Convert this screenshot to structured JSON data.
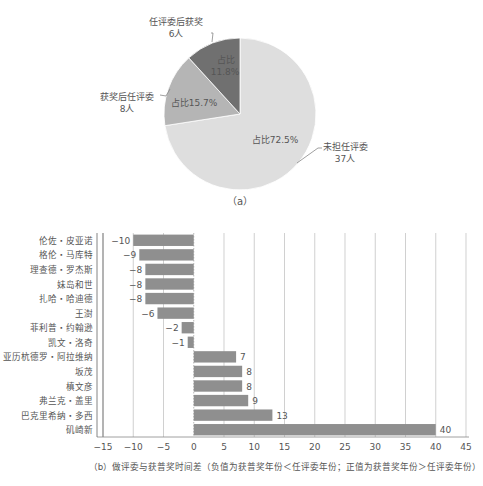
{
  "chart_data": [
    {
      "type": "pie",
      "caption": "（a）",
      "slices": [
        {
          "name": "未担任评委",
          "count_label": "37人",
          "value": 37,
          "pct_label": "占比72.5%",
          "color": "#dedede"
        },
        {
          "name": "获奖后任评委",
          "count_label": "8人",
          "value": 8,
          "pct_label": "占比15.7%",
          "color": "#b5b5b5"
        },
        {
          "name": "任评委后获奖",
          "count_label": "6人",
          "value": 6,
          "pct_label_line1": "占比",
          "pct_label_line2": "11.8%",
          "pct_label": "占比11.8%",
          "color": "#707070"
        }
      ]
    },
    {
      "type": "bar",
      "orientation": "horizontal",
      "caption": "（b）做评委与获普奖时间差（负值为获普奖年份＜任评委年份；正值为获普奖年份＞任评委年份）",
      "categories": [
        "伦佐・皮亚诺",
        "格伦・马库特",
        "理查德・罗杰斯",
        "妹岛和世",
        "扎哈・哈迪德",
        "王澍",
        "菲利普・约翰逊",
        "凯文・洛奇",
        "亚历杭德罗・阿拉维纳",
        "坂茂",
        "槙文彦",
        "弗兰克・盖里",
        "巴克里希纳・多西",
        "矶崎新"
      ],
      "values": [
        -10,
        -9,
        -8,
        -8,
        -8,
        -6,
        -2,
        -1,
        7,
        8,
        8,
        9,
        13,
        40
      ],
      "value_labels": [
        "−10",
        "−9",
        "−8",
        "−8",
        "−8",
        "−6",
        "−2",
        "−1",
        "7",
        "8",
        "8",
        "9",
        "13",
        "40"
      ],
      "xlim": [
        -15,
        45
      ],
      "xticks": [
        -15,
        -10,
        -5,
        0,
        5,
        10,
        15,
        20,
        25,
        30,
        35,
        40,
        45
      ],
      "xtick_labels": [
        "−15",
        "−10",
        "−5",
        "0",
        "5",
        "10",
        "15",
        "20",
        "25",
        "30",
        "35",
        "40",
        "45"
      ],
      "grid": "vertical",
      "bar_color": "#8f8f8f"
    }
  ]
}
